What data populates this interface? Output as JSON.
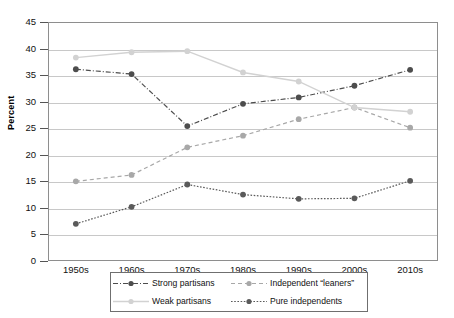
{
  "chart_data": {
    "type": "line",
    "title": "",
    "xlabel": "",
    "ylabel": "Percent",
    "ylim": [
      0,
      45
    ],
    "yticks": [
      0,
      5,
      10,
      15,
      20,
      25,
      30,
      35,
      40,
      45
    ],
    "grid": true,
    "legend_position": "bottom",
    "categories": [
      "1950s",
      "1960s",
      "1970s",
      "1980s",
      "1990s",
      "2000s",
      "2010s"
    ],
    "series": [
      {
        "name": "Strong partisans",
        "values": [
          36.1,
          35.2,
          25.4,
          29.6,
          30.8,
          33.0,
          36.0
        ],
        "color": "#4d4d4d",
        "dash": "dashdot",
        "marker": "circle"
      },
      {
        "name": "Independent “leaners”",
        "values": [
          15.0,
          16.2,
          21.4,
          23.6,
          26.7,
          28.9,
          25.1
        ],
        "color": "#a8a8a8",
        "dash": "dashed",
        "marker": "circle"
      },
      {
        "name": "Weak partisans",
        "values": [
          38.3,
          39.3,
          39.5,
          35.5,
          33.8,
          28.9,
          28.1
        ],
        "color": "#d2d2d2",
        "dash": "solid",
        "marker": "circle"
      },
      {
        "name": "Pure independents",
        "values": [
          7.0,
          10.2,
          14.4,
          12.5,
          11.7,
          11.8,
          15.1
        ],
        "color": "#5a5a5a",
        "dash": "dotted",
        "marker": "circle"
      }
    ]
  },
  "axis": {
    "y_tick_labels": [
      "45",
      "40",
      "35",
      "30",
      "25",
      "20",
      "15",
      "10",
      "5",
      "0"
    ],
    "y_title": "Percent",
    "x_tick_labels": [
      "1950s",
      "1960s",
      "1970s",
      "1980s",
      "1990s",
      "2000s",
      "2010s"
    ]
  },
  "legend": {
    "entries": [
      {
        "label": "Strong partisans"
      },
      {
        "label": "Independent “leaners”"
      },
      {
        "label": "Weak partisans"
      },
      {
        "label": "Pure independents"
      }
    ]
  }
}
